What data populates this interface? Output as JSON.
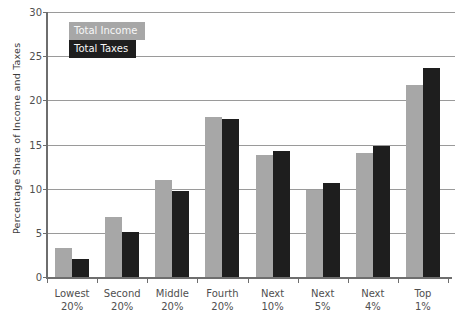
{
  "chart_data": {
    "type": "bar",
    "title": "",
    "xlabel": "",
    "ylabel": "Percentage Share of Income and Taxes",
    "ylim": [
      0,
      30
    ],
    "yticks": [
      0,
      5,
      10,
      15,
      20,
      25,
      30
    ],
    "grid": true,
    "legend_position": "top-left-inside",
    "categories": [
      "Lowest 20%",
      "Second 20%",
      "Middle 20%",
      "Fourth 20%",
      "Next 10%",
      "Next 5%",
      "Next 4%",
      "Top 1%"
    ],
    "series": [
      {
        "name": "Total Income",
        "color": "#a7a7a7",
        "values": [
          3.4,
          6.9,
          11.1,
          18.2,
          13.9,
          10.0,
          14.1,
          21.8
        ]
      },
      {
        "name": "Total Taxes",
        "color": "#1e1e1e",
        "values": [
          2.2,
          5.2,
          9.9,
          18.0,
          14.4,
          10.7,
          15.0,
          23.8
        ]
      }
    ]
  },
  "colors": {
    "gridline": "#9a9a9a",
    "axis": "#6e6e6e",
    "tick_text": "#4f4f4f",
    "background": "#ffffff"
  }
}
